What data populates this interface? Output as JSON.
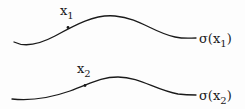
{
  "diagram": {
    "curves": [
      {
        "id": "curve-1",
        "point_label": {
          "base": "x",
          "sub": "1"
        },
        "end_label": {
          "prefix": "σ(x",
          "sub": "1",
          "suffix": ")"
        }
      },
      {
        "id": "curve-2",
        "point_label": {
          "base": "x",
          "sub": "2"
        },
        "end_label": {
          "prefix": "σ(x",
          "sub": "2",
          "suffix": ")"
        }
      }
    ],
    "colors": {
      "stroke": "#1a1a1a",
      "background": "#fdfdfd"
    }
  }
}
